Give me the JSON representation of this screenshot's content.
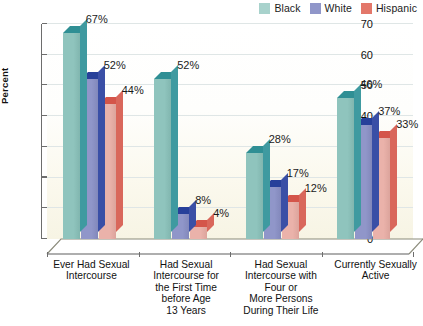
{
  "chart_data": {
    "type": "bar",
    "title": "",
    "xlabel": "",
    "ylabel": "Percent",
    "ylim": [
      0,
      70
    ],
    "ytick_step": 10,
    "yticks": [
      "0",
      "10",
      "20",
      "30",
      "40",
      "50",
      "60",
      "70"
    ],
    "grid": true,
    "legend_position": "top-right",
    "value_suffix": "%",
    "categories": [
      "Ever Had Sexual\nIntercourse",
      "Had Sexual\nIntercourse for\nthe First Time\nbefore Age\n13 Years",
      "Had Sexual\nIntercourse with\nFour or\nMore Persons\nDuring Their Life",
      "Currently Sexually\nActive"
    ],
    "series": [
      {
        "name": "Black",
        "color": "#8fc4bd",
        "top_color": "#2f8f94",
        "side_color": "#3f9aa0",
        "values": [
          67,
          52,
          28,
          46
        ],
        "labels": [
          "67%",
          "52%",
          "28%",
          "46%"
        ]
      },
      {
        "name": "White",
        "color": "#9096c9",
        "top_color": "#27409a",
        "side_color": "#3a4fa6",
        "values": [
          52,
          8,
          17,
          37
        ],
        "labels": [
          "52%",
          "8%",
          "17%",
          "37%"
        ]
      },
      {
        "name": "Hispanic",
        "color": "#eab2aa",
        "top_color": "#d4554a",
        "side_color": "#d9675b",
        "values": [
          44,
          4,
          12,
          33
        ],
        "labels": [
          "44%",
          "4%",
          "12%",
          "33%"
        ]
      }
    ]
  },
  "legend": {
    "items": [
      {
        "label": "Black",
        "color": "#a8d2cc"
      },
      {
        "label": "White",
        "color": "#9096c9"
      },
      {
        "label": "Hispanic",
        "color": "#e3776a"
      }
    ]
  },
  "axis": {
    "y_title": "Percent",
    "y_ticks": [
      "70",
      "60",
      "50",
      "40",
      "30",
      "20",
      "10",
      "0"
    ]
  }
}
